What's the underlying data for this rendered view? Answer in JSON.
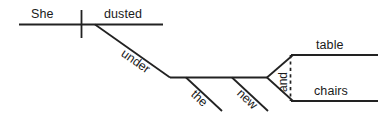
{
  "diagram": {
    "type": "reed-kellogg-sentence-diagram",
    "sentence": "She dusted under the new table and chairs.",
    "stroke_color": "#222222",
    "text_color": "#1a1a1a",
    "background_color": "#ffffff",
    "words": {
      "subject": "She",
      "verb": "dusted",
      "preposition": "under",
      "determiner": "the",
      "adjective": "new",
      "conjunction": "and",
      "object_1": "table",
      "object_2": "chairs"
    }
  }
}
